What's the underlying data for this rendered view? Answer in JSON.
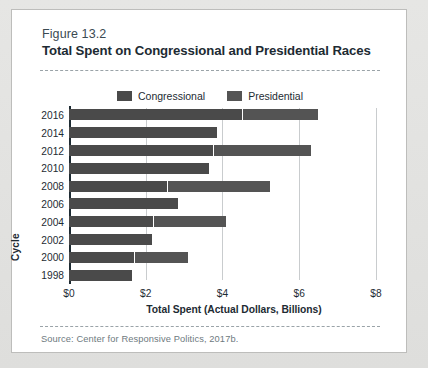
{
  "figure": {
    "label": "Figure 13.2",
    "title": "Total Spent on Congressional and Presidential Races",
    "source": "Source: Center for Responsive Politics, 2017b."
  },
  "colors": {
    "congressional": "#4a4a4a",
    "presidential": "#545454",
    "axis": "#1d2b33",
    "grid": "#c9ccce",
    "card_bg": "#ffffff",
    "page_bg": "#e2e2e0"
  },
  "chart_data": {
    "type": "bar",
    "orientation": "horizontal",
    "stacked": true,
    "title": "Total Spent on Congressional and Presidential Races",
    "subtitle": "Figure 13.2",
    "xlabel": "Total Spent (Actual Dollars, Billions)",
    "ylabel": "Cycle",
    "xlim": [
      0,
      8.6
    ],
    "xticks": [
      0,
      2,
      4,
      6,
      8
    ],
    "xtick_labels": [
      "$0",
      "$2",
      "$4",
      "$6",
      "$8"
    ],
    "grid": "vertical",
    "legend_position": "top-center",
    "categories": [
      "2016",
      "2014",
      "2012",
      "2010",
      "2008",
      "2006",
      "2004",
      "2002",
      "2000",
      "1998"
    ],
    "series": [
      {
        "name": "Congressional",
        "color": "#4a4a4a",
        "values": [
          4.5,
          3.85,
          3.75,
          3.65,
          2.55,
          2.85,
          2.2,
          2.15,
          1.7,
          1.65
        ]
      },
      {
        "name": "Presidential",
        "color": "#545454",
        "values": [
          2.0,
          0,
          2.55,
          0,
          2.7,
          0,
          1.9,
          0,
          1.4,
          0
        ]
      }
    ],
    "totals": [
      6.5,
      3.85,
      6.3,
      3.65,
      5.25,
      2.85,
      4.1,
      2.15,
      3.1,
      1.65
    ]
  },
  "legend": {
    "items": [
      {
        "label": "Congressional"
      },
      {
        "label": "Presidential"
      }
    ]
  }
}
